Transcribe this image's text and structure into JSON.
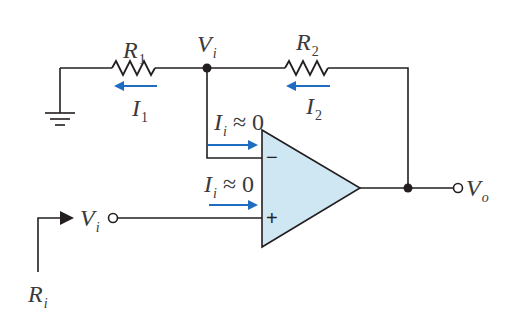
{
  "diagram": {
    "type": "non-inverting op-amp amplifier circuit",
    "colors": {
      "wire": "#231f20",
      "current_arrow": "#1f6dc0",
      "opamp_fill": "#cfe6f3",
      "background": "#ffffff"
    },
    "labels": {
      "r1": {
        "main": "R",
        "sub": "1"
      },
      "r2": {
        "main": "R",
        "sub": "2"
      },
      "vi_node": {
        "main": "V",
        "sub": "i"
      },
      "i1": {
        "main": "I",
        "sub": "1"
      },
      "i2": {
        "main": "I",
        "sub": "2"
      },
      "ii_inverting": {
        "main": "I",
        "sub": "i",
        "rest": "≈ 0"
      },
      "ii_noninverting": {
        "main": "I",
        "sub": "i",
        "rest": "≈ 0"
      },
      "vi_input": {
        "main": "V",
        "sub": "i"
      },
      "vo_output": {
        "main": "V",
        "sub": "o"
      },
      "ri": {
        "main": "R",
        "sub": "i"
      }
    },
    "opamp": {
      "inverting_sign": "−",
      "noninverting_sign": "+"
    },
    "components": [
      {
        "id": "R1",
        "type": "resistor",
        "between": [
          "ground",
          "Vi node"
        ]
      },
      {
        "id": "R2",
        "type": "resistor",
        "between": [
          "Vi node",
          "Vo"
        ]
      },
      {
        "id": "opamp",
        "type": "operational amplifier",
        "inputs": [
          "inverting (−)",
          "non-inverting (+)"
        ],
        "output": "Vo"
      },
      {
        "id": "ground",
        "type": "ground symbol"
      }
    ],
    "currents": [
      {
        "id": "I1",
        "direction": "left",
        "through": "R1"
      },
      {
        "id": "I2",
        "direction": "left",
        "through": "R2"
      },
      {
        "id": "Ii_inv",
        "direction": "right",
        "into": "inverting input",
        "value": "≈ 0"
      },
      {
        "id": "Ii_noninv",
        "direction": "right",
        "into": "non-inverting input",
        "value": "≈ 0"
      }
    ]
  }
}
